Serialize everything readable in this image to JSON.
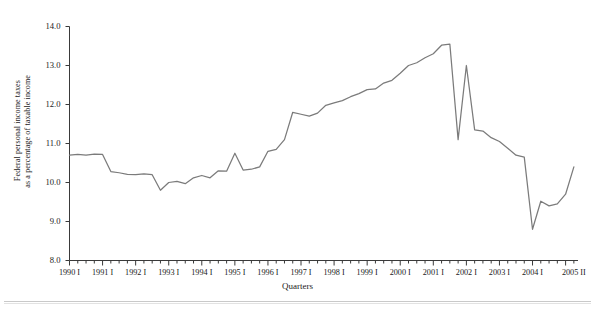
{
  "chart_data": {
    "type": "line",
    "title": "",
    "xlabel": "Quarters",
    "ylabel": "Federal personal income taxes as a percentage of taxable income",
    "ylabel_line1": "Federal personal income taxes",
    "ylabel_line2": "as a percentage of taxable income",
    "ylim": [
      8.0,
      14.0
    ],
    "ytick_values": [
      8.0,
      9.0,
      10.0,
      11.0,
      12.0,
      13.0,
      14.0
    ],
    "ytick_labels": [
      "8.0",
      "9.0",
      "10.0",
      "11.0",
      "12.0",
      "13.0",
      "14.0"
    ],
    "grid": false,
    "legend": "none",
    "line_color": "#7b7b7b",
    "axis_color": "#3a3a3a",
    "xtick_labels": [
      "1990 I",
      "1991 I",
      "1992 I",
      "1993 I",
      "1994 I",
      "1995 I",
      "1996 I",
      "1997 I",
      "1998 I",
      "1999 I",
      "2000 I",
      "2001 I",
      "2002 I",
      "2003 I",
      "2004 I",
      "2005 II"
    ],
    "x_minor_per_year": 4,
    "x_first_quarter": "1990 I",
    "x_last_quarter": "2005 II",
    "n_points": 62,
    "series": [
      {
        "name": "Federal personal income taxes as a percentage of taxable income",
        "x": [
          "1990 I",
          "1990 II",
          "1990 III",
          "1990 IV",
          "1991 I",
          "1991 II",
          "1991 III",
          "1991 IV",
          "1992 I",
          "1992 II",
          "1992 III",
          "1992 IV",
          "1993 I",
          "1993 II",
          "1993 III",
          "1993 IV",
          "1994 I",
          "1994 II",
          "1994 III",
          "1994 IV",
          "1995 I",
          "1995 II",
          "1995 III",
          "1995 IV",
          "1996 I",
          "1996 II",
          "1996 III",
          "1996 IV",
          "1997 I",
          "1997 II",
          "1997 III",
          "1997 IV",
          "1998 I",
          "1998 II",
          "1998 III",
          "1998 IV",
          "1999 I",
          "1999 II",
          "1999 III",
          "1999 IV",
          "2000 I",
          "2000 II",
          "2000 III",
          "2000 IV",
          "2001 I",
          "2001 II",
          "2001 III",
          "2001 IV",
          "2002 I",
          "2002 II",
          "2002 III",
          "2002 IV",
          "2003 I",
          "2003 II",
          "2003 III",
          "2003 IV",
          "2004 I",
          "2004 II",
          "2004 III",
          "2004 IV",
          "2005 I",
          "2005 II"
        ],
        "values": [
          10.7,
          10.72,
          10.7,
          10.73,
          10.72,
          10.28,
          10.25,
          10.21,
          10.2,
          10.22,
          10.2,
          9.8,
          10.0,
          10.03,
          9.97,
          10.12,
          10.18,
          10.12,
          10.3,
          10.29,
          10.75,
          10.32,
          10.34,
          10.4,
          10.8,
          10.85,
          11.1,
          11.8,
          11.75,
          11.7,
          11.78,
          11.98,
          12.04,
          12.1,
          12.2,
          12.28,
          12.38,
          12.4,
          12.55,
          12.62,
          12.8,
          13.0,
          13.07,
          13.2,
          13.3,
          13.52,
          13.55,
          11.1,
          13.0,
          11.35,
          11.32,
          11.15,
          11.05,
          10.88,
          10.7,
          10.65,
          8.8,
          9.52,
          9.4,
          9.45,
          9.7,
          10.4
        ]
      }
    ],
    "annotations": [],
    "notes": {
      "peak_value": 13.55,
      "peak_x": "2001 III",
      "trough_value": 8.8,
      "trough_x": "2004 I"
    }
  }
}
